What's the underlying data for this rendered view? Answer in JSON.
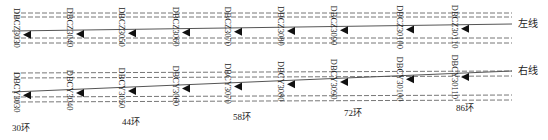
{
  "diagram": {
    "type": "tunnel-monitoring-point-layout",
    "lines": [
      {
        "name": "左线",
        "point_prefix": "DBCZ",
        "points": [
          "DBCZ3030",
          "DBCZ3040",
          "DBCZ3050",
          "DBCZ3060",
          "DBCZ3070",
          "DBCZ3080",
          "DBCZ3090",
          "DBCZ30100",
          "DBCZ30110"
        ]
      },
      {
        "name": "右线",
        "point_prefix": "DBCY",
        "points": [
          "DBCY3030",
          "DBCY3040",
          "DBCY3050",
          "DBCY3060",
          "DBCY3070",
          "DBCY3080",
          "DBCY3090",
          "DBCY30100",
          "DBCY30110"
        ]
      }
    ],
    "rings": [
      "30环",
      "44环",
      "58环",
      "72环",
      "86环"
    ],
    "direction_marker": "◄",
    "colors": {
      "line": "#555555",
      "dash": "#777777",
      "text": "#222222",
      "marker": "#111111"
    }
  }
}
